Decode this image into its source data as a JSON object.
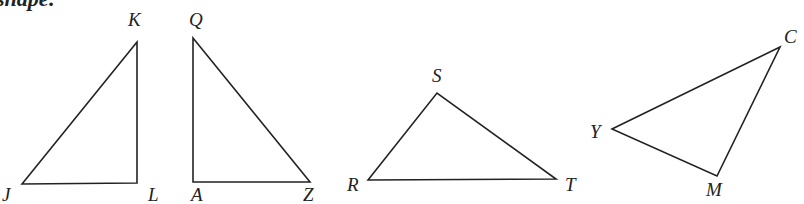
{
  "caption": "shape:",
  "triangles": [
    {
      "name": "JKL",
      "vertices": {
        "J": [
          22,
          184
        ],
        "K": [
          137,
          42
        ],
        "L": [
          137,
          183
        ]
      },
      "labels": [
        {
          "text": "J",
          "x": 2,
          "y": 201
        },
        {
          "text": "K",
          "x": 128,
          "y": 26
        },
        {
          "text": "L",
          "x": 148,
          "y": 201
        }
      ]
    },
    {
      "name": "QAZ",
      "vertices": {
        "Q": [
          193,
          38
        ],
        "A": [
          193,
          182
        ],
        "Z": [
          310,
          182
        ]
      },
      "labels": [
        {
          "text": "Q",
          "x": 189,
          "y": 26
        },
        {
          "text": "A",
          "x": 191,
          "y": 201
        },
        {
          "text": "Z",
          "x": 303,
          "y": 201
        }
      ]
    },
    {
      "name": "RST",
      "vertices": {
        "R": [
          368,
          180
        ],
        "S": [
          437,
          93
        ],
        "T": [
          556,
          179
        ]
      },
      "labels": [
        {
          "text": "S",
          "x": 432,
          "y": 82
        },
        {
          "text": "R",
          "x": 347,
          "y": 191
        },
        {
          "text": "T",
          "x": 565,
          "y": 191
        }
      ]
    },
    {
      "name": "YCM",
      "vertices": {
        "Y": [
          612,
          129
        ],
        "C": [
          780,
          47
        ],
        "M": [
          717,
          176
        ]
      },
      "labels": [
        {
          "text": "C",
          "x": 784,
          "y": 43
        },
        {
          "text": "Y",
          "x": 590,
          "y": 138
        },
        {
          "text": "M",
          "x": 706,
          "y": 196
        }
      ]
    }
  ]
}
